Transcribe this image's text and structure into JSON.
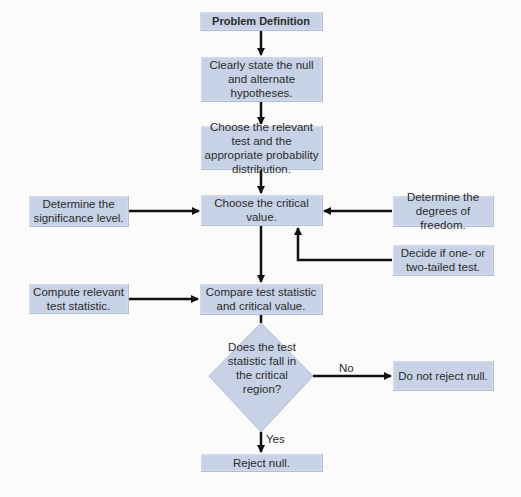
{
  "diagram": {
    "type": "flowchart",
    "colors": {
      "box_fill": "#c7d2e6",
      "line": "#111111",
      "text": "#2b2b2b",
      "background": "#fbfbfb"
    },
    "nodes": {
      "problem_definition": "Problem Definition",
      "state_hypotheses": "Clearly state the null and alternate hypotheses.",
      "choose_test": "Choose the relevant test and the appropriate probability distribution.",
      "choose_critical": "Choose the critical value.",
      "significance": "Determine the significance level.",
      "degrees_freedom": "Determine the degrees of freedom.",
      "tails": "Decide if one- or two-tailed test.",
      "compute_statistic": "Compute relevant test statistic.",
      "compare": "Compare test statistic and critical value.",
      "decision": "Does the test statistic fall in the critical region?",
      "do_not_reject": "Do not reject null.",
      "reject": "Reject null."
    },
    "edge_labels": {
      "no": "No",
      "yes": "Yes"
    }
  }
}
